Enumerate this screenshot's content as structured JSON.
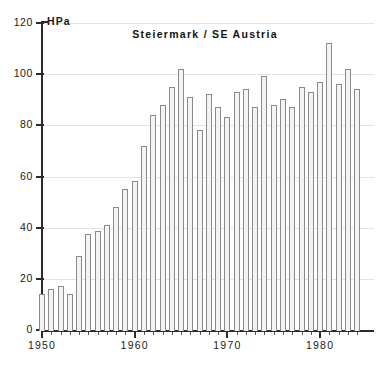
{
  "chart_data": {
    "type": "bar",
    "title": "Steiermark / SE  Austria",
    "xlabel": "",
    "ylabel": "HPa",
    "unit": "HPa",
    "ylim": [
      0,
      120
    ],
    "xlim": [
      1949,
      1985
    ],
    "yticks": [
      0,
      20,
      40,
      60,
      80,
      100,
      120
    ],
    "ytick_labels": [
      "0",
      "20",
      "40",
      "60",
      "80",
      "100",
      "120"
    ],
    "xticks": [
      1950,
      1960,
      1970,
      1980
    ],
    "xtick_labels": [
      "1950",
      "1960",
      "1970",
      "1980"
    ],
    "grid": true,
    "legend": null,
    "bar_fill": "#f3f3f3",
    "bar_edge": "#8a8a8a",
    "axis_color": "#2b2b2b",
    "grid_color": "#e2e2e2",
    "categories": [
      1950,
      1951,
      1952,
      1953,
      1954,
      1955,
      1956,
      1957,
      1958,
      1959,
      1960,
      1961,
      1962,
      1963,
      1964,
      1965,
      1966,
      1967,
      1968,
      1969,
      1970,
      1971,
      1972,
      1973,
      1974,
      1975,
      1976,
      1977,
      1978,
      1979,
      1980,
      1981,
      1982,
      1983,
      1984
    ],
    "values": [
      14.5,
      16.5,
      17.5,
      14.5,
      29.5,
      38.0,
      39.0,
      41.5,
      48.5,
      55.5,
      58.5,
      72.5,
      84.5,
      88.5,
      95.5,
      102.5,
      91.5,
      78.5,
      92.5,
      87.5,
      83.5,
      93.5,
      94.5,
      87.5,
      99.5,
      88.5,
      90.5,
      87.5,
      95.5,
      93.5,
      97.5,
      112.5,
      96.5,
      102.5,
      94.5
    ]
  },
  "caption": {
    "text": ""
  }
}
